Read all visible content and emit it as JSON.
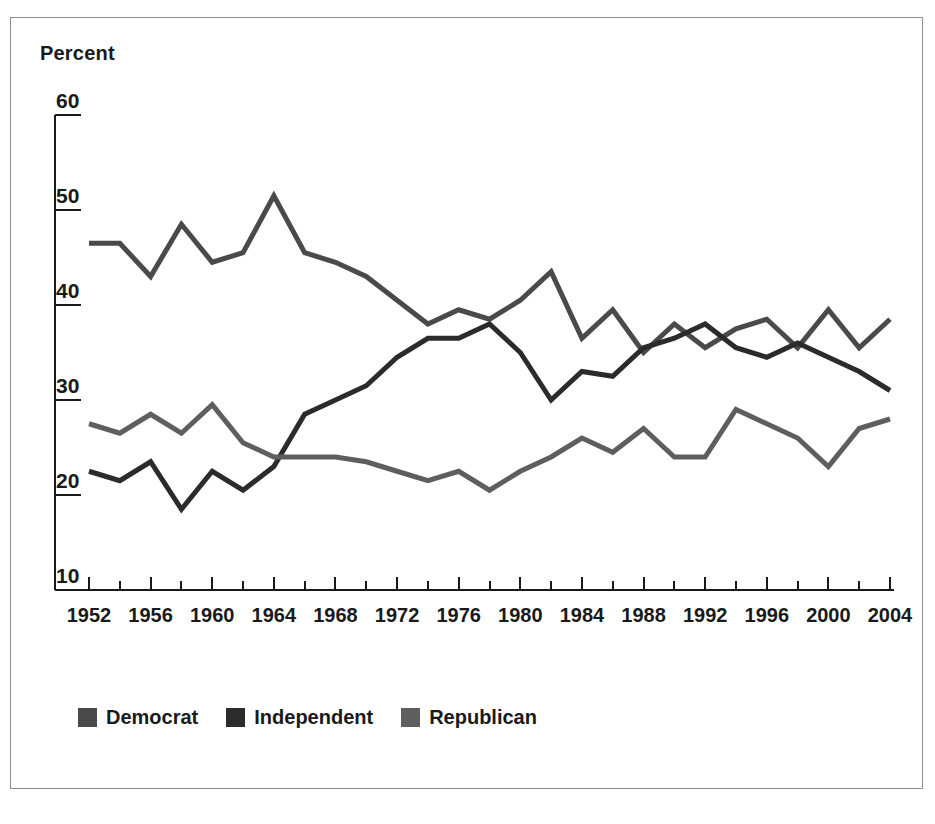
{
  "figure": {
    "y_axis_title": "Percent",
    "border_color": "#8e8e8e",
    "background": "#ffffff"
  },
  "legend": {
    "items": [
      {
        "label": "Democrat",
        "color": "#4a4a4a",
        "swatch_name": "legend-swatch-democrat"
      },
      {
        "label": "Independent",
        "color": "#2b2b2b",
        "swatch_name": "legend-swatch-independent"
      },
      {
        "label": "Republican",
        "color": "#5e5e5e",
        "swatch_name": "legend-swatch-republican"
      }
    ]
  },
  "chart_data": {
    "type": "line",
    "title": "",
    "subtitle": "",
    "xlabel": "",
    "ylabel": "Percent",
    "xlim": [
      1952,
      2004
    ],
    "ylim": [
      10,
      60
    ],
    "ytick_values": [
      60,
      50,
      40,
      30,
      20,
      10
    ],
    "ytick_labels": [
      "60",
      "50",
      "40",
      "30",
      "20",
      "10"
    ],
    "xtick_labels": [
      "1952",
      "1956",
      "1960",
      "1964",
      "1968",
      "1972",
      "1976",
      "1980",
      "1984",
      "1988",
      "1992",
      "1996",
      "2000",
      "2004"
    ],
    "xtick_values": [
      1952,
      1956,
      1960,
      1964,
      1968,
      1972,
      1976,
      1980,
      1984,
      1988,
      1992,
      1996,
      2000,
      2004
    ],
    "minor_xtick_values": [
      1954,
      1958,
      1962,
      1966,
      1970,
      1974,
      1978,
      1982,
      1986,
      1990,
      1994,
      1998,
      2002
    ],
    "grid": false,
    "legend_position": "bottom-left",
    "x": [
      1952,
      1954,
      1956,
      1958,
      1960,
      1962,
      1964,
      1966,
      1968,
      1970,
      1972,
      1974,
      1976,
      1978,
      1980,
      1982,
      1984,
      1986,
      1988,
      1990,
      1992,
      1994,
      1996,
      1998,
      2000,
      2002,
      2004
    ],
    "series": [
      {
        "name": "Democrat",
        "color": "#4a4a4a",
        "values": [
          46.5,
          46.5,
          43.0,
          48.5,
          44.5,
          45.5,
          51.5,
          45.5,
          44.5,
          43.0,
          40.5,
          38.0,
          39.5,
          38.5,
          40.5,
          43.5,
          36.5,
          39.5,
          35.0,
          38.0,
          35.5,
          37.5,
          38.5,
          35.5,
          39.5,
          35.5,
          38.5
        ]
      },
      {
        "name": "Independent",
        "color": "#2b2b2b",
        "values": [
          22.5,
          21.5,
          23.5,
          18.5,
          22.5,
          20.5,
          23.0,
          28.5,
          30.0,
          31.5,
          34.5,
          36.5,
          36.5,
          38.0,
          35.0,
          30.0,
          33.0,
          32.5,
          35.5,
          36.5,
          38.0,
          35.5,
          34.5,
          36.0,
          34.5,
          33.0,
          31.0
        ]
      },
      {
        "name": "Republican",
        "color": "#5e5e5e",
        "values": [
          27.5,
          26.5,
          28.5,
          26.5,
          29.5,
          25.5,
          24.0,
          24.0,
          24.0,
          23.5,
          22.5,
          21.5,
          22.5,
          20.5,
          22.5,
          24.0,
          26.0,
          24.5,
          27.0,
          24.0,
          24.0,
          29.0,
          27.5,
          26.0,
          23.0,
          27.0,
          28.0
        ]
      }
    ]
  }
}
